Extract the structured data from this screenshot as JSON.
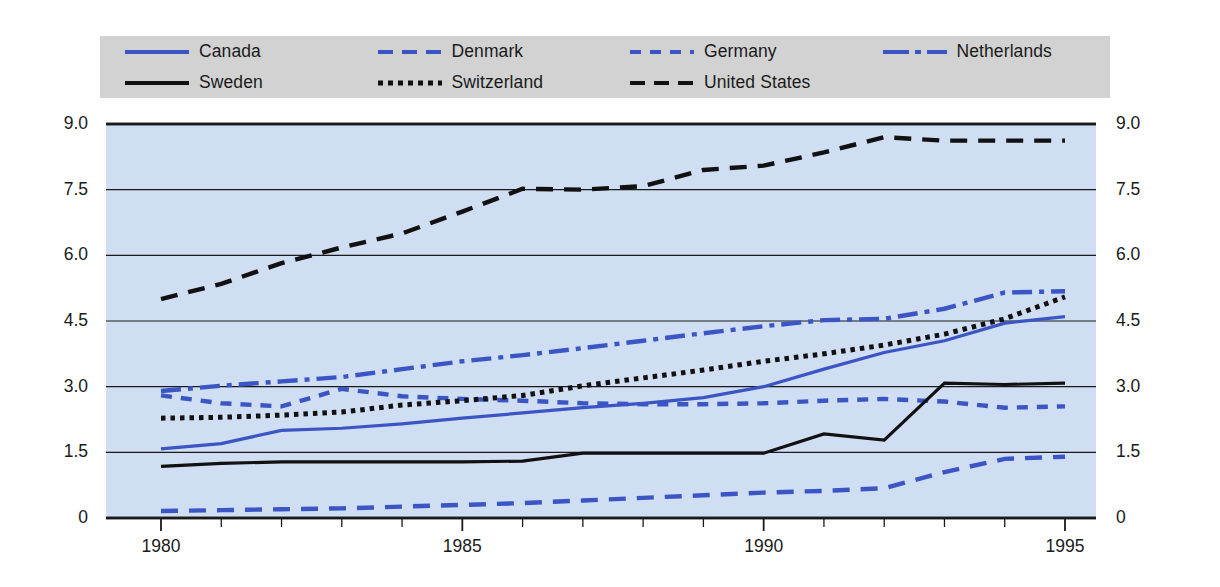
{
  "legend": {
    "items": [
      {
        "label": "Canada",
        "color": "#3b56c4",
        "style": "solid",
        "name": "legend-item-canada"
      },
      {
        "label": "Denmark",
        "color": "#3b56c4",
        "style": "long-dash",
        "name": "legend-item-denmark"
      },
      {
        "label": "Germany",
        "color": "#3b56c4",
        "style": "short-dash",
        "name": "legend-item-germany"
      },
      {
        "label": "Netherlands",
        "color": "#3b56c4",
        "style": "dash-dot",
        "name": "legend-item-netherlands"
      },
      {
        "label": "Sweden",
        "color": "#111111",
        "style": "solid",
        "name": "legend-item-sweden"
      },
      {
        "label": "Switzerland",
        "color": "#111111",
        "style": "dotted",
        "name": "legend-item-switzerland"
      },
      {
        "label": "United States",
        "color": "#111111",
        "style": "long-dash",
        "name": "legend-item-united-states"
      }
    ],
    "background": "#d2d2d2"
  },
  "chart_data": {
    "type": "line",
    "title": "",
    "xlabel": "",
    "ylabel": "",
    "xlim": [
      1980,
      1995
    ],
    "ylim": [
      0,
      9.0
    ],
    "grid": true,
    "legend_position": "top",
    "plot_background": "#cfdef2",
    "y_ticks": [
      "0",
      "1.5",
      "3.0",
      "4.5",
      "6.0",
      "7.5",
      "9.0"
    ],
    "y_tick_values": [
      0,
      1.5,
      3.0,
      4.5,
      6.0,
      7.5,
      9.0
    ],
    "x_ticks": [
      "1980",
      "1985",
      "1990",
      "1995"
    ],
    "x_tick_values": [
      1980,
      1985,
      1990,
      1995
    ],
    "x_minor_ticks": [
      1981,
      1982,
      1983,
      1984,
      1986,
      1987,
      1988,
      1989,
      1991,
      1992,
      1993,
      1994
    ],
    "x": [
      1980,
      1981,
      1982,
      1983,
      1984,
      1985,
      1986,
      1987,
      1988,
      1989,
      1990,
      1991,
      1992,
      1993,
      1994,
      1995
    ],
    "series": [
      {
        "name": "Canada",
        "color": "#3b56c4",
        "style": "solid",
        "values": [
          1.58,
          1.7,
          2.0,
          2.05,
          2.15,
          2.28,
          2.4,
          2.52,
          2.62,
          2.75,
          3.0,
          3.4,
          3.78,
          4.05,
          4.45,
          4.6
        ]
      },
      {
        "name": "Denmark",
        "color": "#3b56c4",
        "style": "long-dash",
        "values": [
          0.16,
          0.18,
          0.2,
          0.22,
          0.26,
          0.3,
          0.34,
          0.4,
          0.46,
          0.52,
          0.58,
          0.62,
          0.68,
          1.05,
          1.35,
          1.4
        ]
      },
      {
        "name": "Germany",
        "color": "#3b56c4",
        "style": "short-dash",
        "values": [
          2.8,
          2.62,
          2.55,
          2.95,
          2.78,
          2.72,
          2.68,
          2.62,
          2.6,
          2.6,
          2.62,
          2.68,
          2.72,
          2.66,
          2.52,
          2.55
        ]
      },
      {
        "name": "Netherlands",
        "color": "#3b56c4",
        "style": "dash-dot",
        "values": [
          2.9,
          3.02,
          3.12,
          3.22,
          3.4,
          3.58,
          3.72,
          3.88,
          4.05,
          4.22,
          4.38,
          4.52,
          4.55,
          4.78,
          5.15,
          5.18
        ]
      },
      {
        "name": "Sweden",
        "color": "#111111",
        "style": "solid",
        "values": [
          1.18,
          1.25,
          1.28,
          1.28,
          1.28,
          1.28,
          1.3,
          1.48,
          1.48,
          1.48,
          1.48,
          1.92,
          1.78,
          3.08,
          3.05,
          3.08
        ]
      },
      {
        "name": "Switzerland",
        "color": "#111111",
        "style": "dotted",
        "values": [
          2.28,
          2.3,
          2.35,
          2.42,
          2.58,
          2.68,
          2.8,
          3.02,
          3.2,
          3.38,
          3.58,
          3.75,
          3.95,
          4.2,
          4.55,
          5.05
        ]
      },
      {
        "name": "United States",
        "color": "#111111",
        "style": "long-dash",
        "values": [
          5.0,
          5.35,
          5.82,
          6.18,
          6.5,
          7.0,
          7.52,
          7.5,
          7.58,
          7.95,
          8.05,
          8.35,
          8.7,
          8.62,
          8.62,
          8.62
        ]
      }
    ]
  }
}
